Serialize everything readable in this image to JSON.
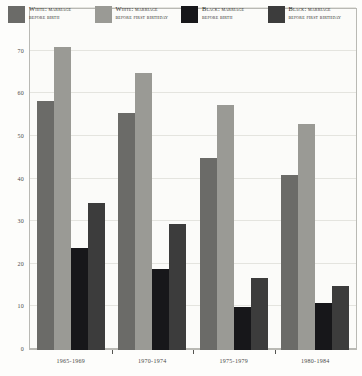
{
  "chart_data": {
    "type": "bar",
    "title": "",
    "subtitle": "",
    "xlabel": "",
    "ylabel": "",
    "categories": [
      "1965-1969",
      "1970-1974",
      "1975-1979",
      "1980-1984"
    ],
    "series": [
      {
        "name": "White: marriage before birth",
        "color": "#6b6b68",
        "values": [
          58.5,
          55.5,
          45,
          41
        ]
      },
      {
        "name": "White: marriage before first birthday",
        "color": "#9a9a95",
        "values": [
          71,
          65,
          57.5,
          53
        ]
      },
      {
        "name": "Black: marriage before birth",
        "color": "#17171a",
        "values": [
          24,
          19,
          10,
          11
        ]
      },
      {
        "name": "Black: marriage before first birthday",
        "color": "#3c3c3c",
        "values": [
          34.5,
          29.5,
          17,
          15
        ]
      }
    ],
    "ylim": [
      0,
      80
    ],
    "yticks": [
      0,
      10,
      20,
      30,
      40,
      50,
      60,
      70,
      80
    ],
    "ytick_labels": [
      "0",
      "10",
      "20",
      "30",
      "40",
      "50",
      "60",
      "70",
      "80"
    ],
    "grid": true,
    "legend_position": "top"
  },
  "legend": {
    "items": [
      {
        "label": "White: marriage before birth",
        "swatch_name": "legend-swatch-white-before-birth"
      },
      {
        "label": "White: marriage before first birthday",
        "swatch_name": "legend-swatch-white-before-first-birthday"
      },
      {
        "label": "Black: marriage before birth",
        "swatch_name": "legend-swatch-black-before-birth"
      },
      {
        "label": "Black: marriage before first birthday",
        "swatch_name": "legend-swatch-black-before-first-birthday"
      }
    ]
  }
}
